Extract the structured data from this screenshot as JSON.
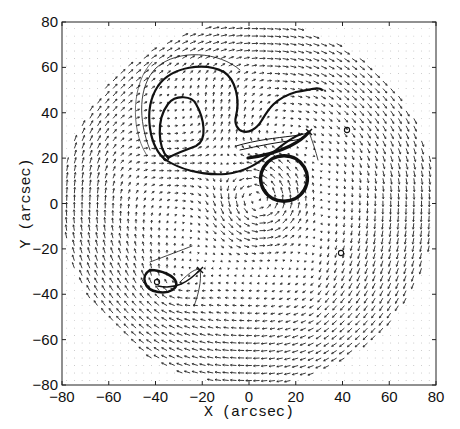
{
  "chart_data": {
    "type": "quiver",
    "title": "",
    "xlabel": "X (arcsec)",
    "ylabel": "Y (arcsec)",
    "xlim": [
      -80,
      80
    ],
    "ylim": [
      -80,
      80
    ],
    "xticks": [
      -80,
      -60,
      -40,
      -20,
      0,
      20,
      40,
      60,
      80
    ],
    "yticks": [
      -80,
      -60,
      -40,
      -20,
      0,
      20,
      40,
      60,
      80
    ],
    "grid": false,
    "background": "dotted grid of zero-length vectors outside disk",
    "field_radius_arcsec": 80,
    "features": [
      {
        "name": "central-vortex-ring",
        "center": [
          5,
          1
        ],
        "radius": 10,
        "style": "thick"
      },
      {
        "name": "upper-left-outer-loop",
        "approx_extent": {
          "x": [
            -46,
            2
          ],
          "y": [
            12,
            55
          ]
        },
        "style": "thick"
      },
      {
        "name": "upper-left-inner-loop",
        "approx_extent": {
          "x": [
            -40,
            -18
          ],
          "y": [
            20,
            48
          ]
        },
        "style": "thick"
      },
      {
        "name": "upper-streamline-tail",
        "from": [
          -5,
          17
        ],
        "to": [
          22,
          25
        ],
        "continues_to": [
          35,
          47
        ]
      },
      {
        "name": "lower-left-loop",
        "approx_extent": {
          "x": [
            -40,
            -28
          ],
          "y": [
            -42,
            -31
          ]
        },
        "style": "thick"
      },
      {
        "name": "x-marker-upper",
        "position": [
          25,
          30
        ]
      },
      {
        "name": "x-marker-lower",
        "position": [
          -22,
          -31
        ]
      }
    ],
    "circle_markers": [
      {
        "position": [
          -32,
          20
        ]
      },
      {
        "position": [
          42,
          33
        ]
      },
      {
        "position": [
          40,
          -21
        ]
      },
      {
        "position": [
          -34,
          -36
        ]
      }
    ]
  },
  "axes": {
    "x_tick_labels": [
      "−80",
      "−60",
      "−40",
      "−20",
      "0",
      "20",
      "40",
      "60",
      "80"
    ],
    "y_tick_labels": [
      "80",
      "60",
      "40",
      "20",
      "0",
      "−20",
      "−40",
      "−60",
      "−80"
    ],
    "xlabel": "X (arcsec)",
    "ylabel": "Y (arcsec)"
  }
}
